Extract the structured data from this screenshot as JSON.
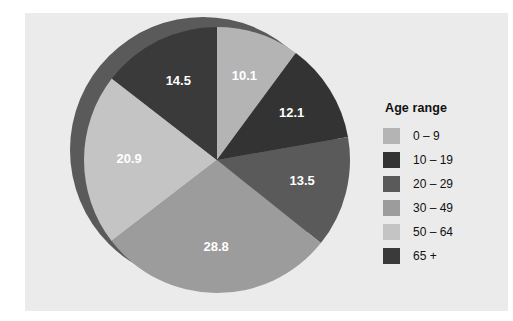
{
  "legend": {
    "title": "Age range",
    "items": [
      {
        "label": "0 – 9",
        "color": "#b4b4b4"
      },
      {
        "label": "10 – 19",
        "color": "#333333"
      },
      {
        "label": "20 – 29",
        "color": "#5a5a5a"
      },
      {
        "label": "30 – 49",
        "color": "#9c9c9c"
      },
      {
        "label": "50 – 64",
        "color": "#c4c4c4"
      },
      {
        "label": "65 +",
        "color": "#3a3a3a"
      }
    ]
  },
  "chart_data": {
    "type": "pie",
    "title": "",
    "legend_title": "Age range",
    "legend_position": "right",
    "categories": [
      "0 – 9",
      "10 – 19",
      "20 – 29",
      "30 – 49",
      "50 – 64",
      "65 +"
    ],
    "values": [
      10.1,
      12.1,
      13.5,
      28.8,
      20.9,
      14.5
    ],
    "labels": [
      "10.1",
      "12.1",
      "13.5",
      "28.8",
      "20.9",
      "14.5"
    ],
    "colors": [
      "#b4b4b4",
      "#333333",
      "#5a5a5a",
      "#9c9c9c",
      "#c4c4c4",
      "#3a3a3a"
    ],
    "start_angle_deg": 0,
    "direction": "clockwise",
    "units": "percent",
    "total": 99.9,
    "shadow_color": "#5a5a5a",
    "background_color": "#ebebeb"
  }
}
